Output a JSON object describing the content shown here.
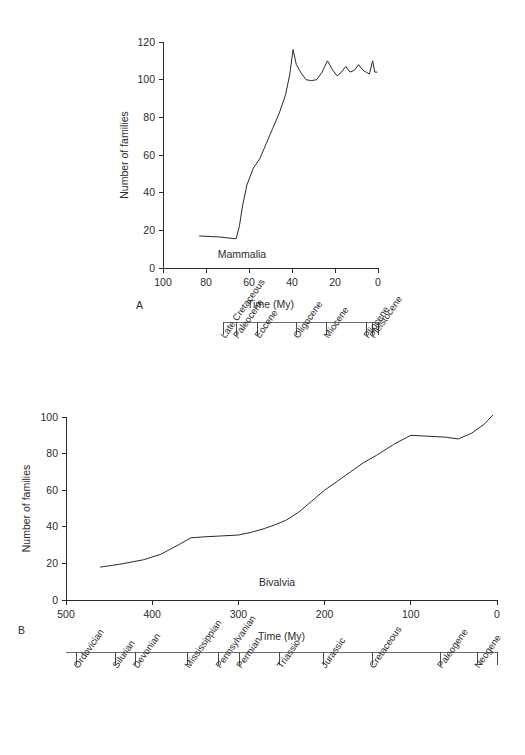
{
  "figure": {
    "background": "#ffffff",
    "line_color": "#2b2b2b",
    "scale_bar_color": "#6e6e6e",
    "panel_a_letter": "A",
    "panel_b_letter": "B"
  },
  "chart_data": [
    {
      "id": "panel-a",
      "type": "line",
      "title": "",
      "series_label": "Mammalia",
      "xlabel": "Time (My)",
      "ylabel": "Number of families",
      "xlim": [
        100,
        0
      ],
      "ylim": [
        0,
        120
      ],
      "x_reversed": true,
      "grid": false,
      "legend": "none",
      "xticks": [
        100,
        80,
        60,
        40,
        20,
        0
      ],
      "yticks": [
        0,
        20,
        40,
        60,
        80,
        100,
        120
      ],
      "x": [
        83,
        74,
        66,
        64.5,
        63,
        61,
        58,
        55,
        52,
        49,
        46,
        43,
        41,
        39.5,
        38,
        36,
        33.5,
        31,
        28.5,
        26,
        23.5,
        21,
        19,
        17,
        15,
        13,
        11,
        9,
        7,
        5.5,
        4,
        2.5,
        1.5,
        0.5
      ],
      "values": [
        17,
        16.5,
        15.5,
        22,
        33,
        44,
        53,
        58,
        66,
        74,
        82,
        92,
        103,
        116,
        108,
        104,
        100,
        99.5,
        100,
        104,
        110,
        105,
        102,
        104,
        107,
        104,
        105,
        108,
        105,
        104,
        103,
        110,
        104,
        104
      ],
      "scale_bar": {
        "label": "epochs",
        "axis_units": "My",
        "start_my": 72,
        "end_my": 0,
        "boundaries_my": [
          72,
          66,
          56,
          38,
          24,
          5.3,
          2.6,
          0
        ],
        "intervals": [
          {
            "name": "Late Cretaceous",
            "from_my": 72,
            "to_my": 66
          },
          {
            "name": "Paleocene",
            "from_my": 66,
            "to_my": 56
          },
          {
            "name": "Eocene",
            "from_my": 56,
            "to_my": 38
          },
          {
            "name": "Oligocene",
            "from_my": 38,
            "to_my": 24
          },
          {
            "name": "Miocene",
            "from_my": 24,
            "to_my": 5.3
          },
          {
            "name": "Pliocene",
            "from_my": 5.3,
            "to_my": 2.6
          },
          {
            "name": "Pleistocene",
            "from_my": 2.6,
            "to_my": 0
          }
        ]
      }
    },
    {
      "id": "panel-b",
      "type": "line",
      "title": "",
      "series_label": "Bivalvia",
      "xlabel": "Time (My)",
      "ylabel": "Number of families",
      "xlim": [
        500,
        0
      ],
      "ylim": [
        0,
        100
      ],
      "x_reversed": true,
      "grid": false,
      "legend": "none",
      "xticks": [
        500,
        400,
        300,
        200,
        100,
        0
      ],
      "yticks": [
        0,
        20,
        40,
        60,
        80,
        100
      ],
      "x": [
        460,
        438,
        410,
        390,
        370,
        355,
        340,
        320,
        300,
        285,
        270,
        258,
        245,
        230,
        215,
        200,
        185,
        170,
        155,
        140,
        120,
        100,
        80,
        60,
        45,
        30,
        15,
        5
      ],
      "values": [
        18,
        19.5,
        22,
        25,
        30,
        34,
        34.5,
        35,
        35.5,
        37,
        39,
        41,
        43.5,
        48,
        54,
        60,
        65,
        70,
        75,
        79,
        85,
        90,
        89.5,
        89,
        88,
        91,
        96,
        101
      ],
      "scale_bar": {
        "label": "periods",
        "axis_units": "My",
        "start_my": 500,
        "end_my": 0,
        "boundaries_my": [
          488,
          443,
          419,
          359,
          323,
          299,
          252,
          201,
          145,
          66,
          23,
          0
        ],
        "intervals": [
          {
            "name": "Ordovician",
            "from_my": 488,
            "to_my": 443
          },
          {
            "name": "Silurian",
            "from_my": 443,
            "to_my": 419
          },
          {
            "name": "Devonian",
            "from_my": 419,
            "to_my": 359
          },
          {
            "name": "Mississippian",
            "from_my": 359,
            "to_my": 323
          },
          {
            "name": "Pennsylvanian",
            "from_my": 323,
            "to_my": 299
          },
          {
            "name": "Permian",
            "from_my": 299,
            "to_my": 252
          },
          {
            "name": "Triassic",
            "from_my": 252,
            "to_my": 201
          },
          {
            "name": "Jurassic",
            "from_my": 201,
            "to_my": 145
          },
          {
            "name": "Cretaceous",
            "from_my": 145,
            "to_my": 66
          },
          {
            "name": "Paleogene",
            "from_my": 66,
            "to_my": 23
          },
          {
            "name": "Neogene",
            "from_my": 23,
            "to_my": 0
          }
        ]
      }
    }
  ]
}
